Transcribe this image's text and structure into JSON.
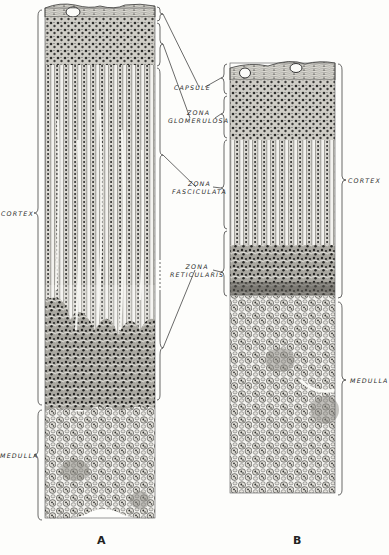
{
  "figure": {
    "type": "histology-illustration",
    "panels": [
      {
        "id": "A",
        "letter": "A",
        "left_labels": [
          {
            "key": "cortex",
            "text": "CORTEX"
          },
          {
            "key": "medulla",
            "text": "MEDULLA"
          }
        ]
      },
      {
        "id": "B",
        "letter": "B",
        "right_labels": [
          {
            "key": "cortex",
            "text": "CORTEX"
          },
          {
            "key": "medulla",
            "text": "MEDULLA"
          }
        ]
      }
    ],
    "center_labels": [
      {
        "key": "capsule",
        "line1": "CAPSULE",
        "line2": ""
      },
      {
        "key": "zona_glomerulosa",
        "line1": "ZONA",
        "line2": "GLOMERULOSA"
      },
      {
        "key": "zona_fasciculata",
        "line1": "ZONA",
        "line2": "FASCICULATA"
      },
      {
        "key": "zona_reticularis",
        "line1": "ZONA",
        "line2": "RETICULARIS"
      }
    ],
    "colors": {
      "ink": "#2a2a2a",
      "paper": "#fdfdfb",
      "tissue_light": "#e8e6e0",
      "tissue_dark": "#6a6a66"
    }
  }
}
